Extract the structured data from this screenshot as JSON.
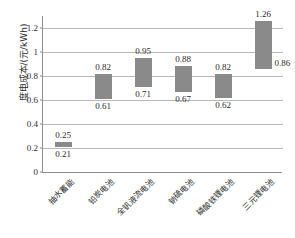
{
  "chart_data": {
    "type": "bar",
    "subtype": "floating-range-bar",
    "title": "",
    "xlabel": "",
    "ylabel": "度电成本/(元/kWh)",
    "ylim": [
      0,
      1.3
    ],
    "yticks": [
      0,
      0.2,
      0.4,
      0.6,
      0.8,
      1,
      1.2
    ],
    "ytick_labels": [
      "0",
      "0.2",
      "0.4",
      "0.6",
      "0.8",
      "1",
      "1.2"
    ],
    "grid": true,
    "legend": false,
    "bar_color": "#8a8a8a",
    "gridline_color": "#b9b9b9",
    "axis_color": "#8d8d8d",
    "categories": [
      "抽水蓄能",
      "铅炭电池",
      "全钒液流电池",
      "钠硫电池",
      "磷酸铁锂电池",
      "三元锂电池"
    ],
    "series": [
      {
        "name": "下限",
        "values": [
          0.21,
          0.61,
          0.71,
          0.67,
          0.62,
          0.86
        ]
      },
      {
        "name": "上限",
        "values": [
          0.25,
          0.82,
          0.95,
          0.88,
          0.82,
          1.26
        ]
      }
    ],
    "bars": [
      {
        "category": "抽水蓄能",
        "low": 0.21,
        "high": 0.25,
        "low_label": "0.21",
        "high_label": "0.25",
        "low_label_pos": "below",
        "high_label_pos": "above"
      },
      {
        "category": "铅炭电池",
        "low": 0.61,
        "high": 0.82,
        "low_label": "0.61",
        "high_label": "0.82",
        "low_label_pos": "below",
        "high_label_pos": "above"
      },
      {
        "category": "全钒液流电池",
        "low": 0.71,
        "high": 0.95,
        "low_label": "0.71",
        "high_label": "0.95",
        "low_label_pos": "below",
        "high_label_pos": "above"
      },
      {
        "category": "钠硫电池",
        "low": 0.67,
        "high": 0.88,
        "low_label": "0.67",
        "high_label": "0.88",
        "low_label_pos": "below",
        "high_label_pos": "above"
      },
      {
        "category": "磷酸铁锂电池",
        "low": 0.62,
        "high": 0.82,
        "low_label": "0.62",
        "high_label": "0.82",
        "low_label_pos": "below",
        "high_label_pos": "above"
      },
      {
        "category": "三元锂电池",
        "low": 0.86,
        "high": 1.26,
        "low_label": "0.86",
        "high_label": "1.26",
        "low_label_pos": "right",
        "high_label_pos": "above"
      }
    ]
  }
}
